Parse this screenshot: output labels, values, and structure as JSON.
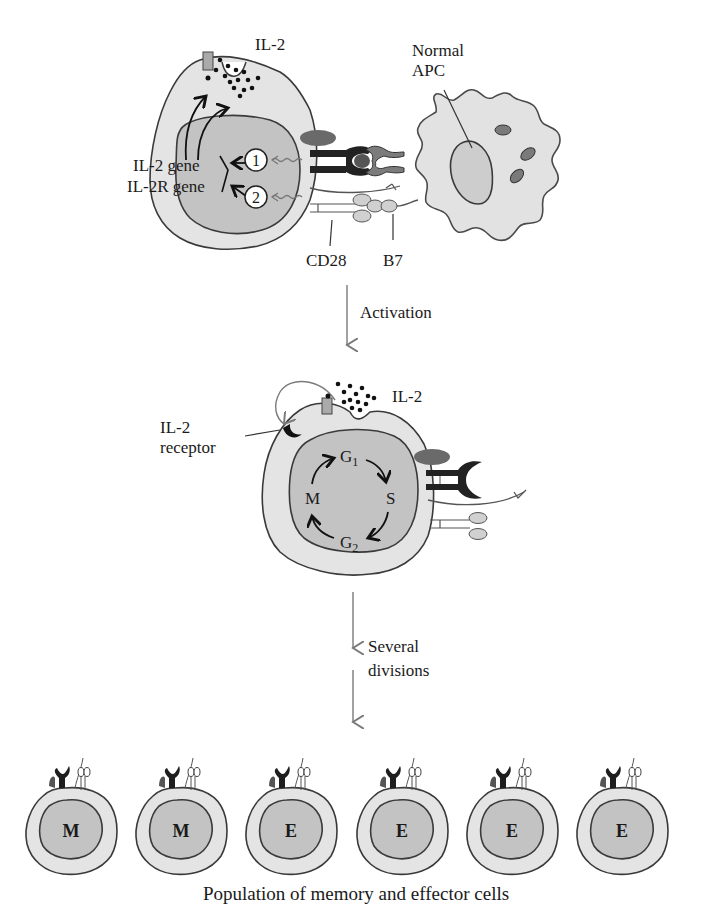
{
  "figure": {
    "panel_top": {
      "il2_label": "IL-2",
      "apc_label_line1": "Normal",
      "apc_label_line2": "APC",
      "gene_label_1": "IL-2 gene",
      "gene_label_2": "IL-2R gene",
      "signal_1": "1",
      "signal_2": "2",
      "cd28_label": "CD28",
      "b7_label": "B7"
    },
    "step_1": {
      "label": "Activation"
    },
    "panel_middle": {
      "il2_label": "IL-2",
      "receptor_label_line1": "IL-2",
      "receptor_label_line2": "receptor",
      "cell_cycle": {
        "g1": "G",
        "g1_sub": "1",
        "s": "S",
        "g2": "G",
        "g2_sub": "2",
        "m": "M"
      }
    },
    "step_2": {
      "label_line1": "Several",
      "label_line2": "divisions"
    },
    "panel_bottom": {
      "cells": [
        {
          "type": "M"
        },
        {
          "type": "M"
        },
        {
          "type": "E"
        },
        {
          "type": "E"
        },
        {
          "type": "E"
        },
        {
          "type": "E"
        }
      ],
      "caption": "Population of memory and effector cells"
    }
  }
}
